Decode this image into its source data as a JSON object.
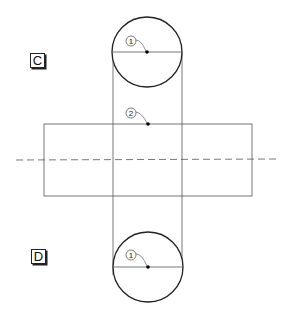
{
  "labels": {
    "top": "C",
    "bottom": "D"
  },
  "callouts": {
    "top_circle_center": "1",
    "rectangle_top_mid": "2",
    "bottom_circle_center": "1"
  },
  "colors": {
    "stroke": "#222222",
    "thin_stroke": "#555555",
    "background": "#ffffff"
  }
}
